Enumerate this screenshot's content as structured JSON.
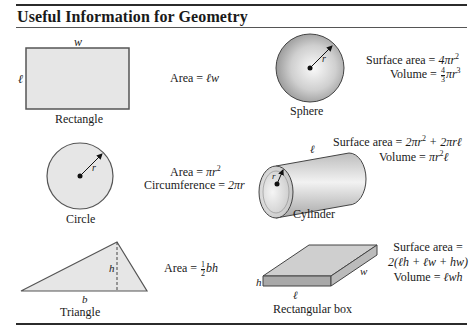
{
  "header": {
    "title": "Useful Information for Geometry"
  },
  "shapes": [
    {
      "name": "Rectangle",
      "dimension_labels": {
        "top": "w",
        "side": "ℓ"
      },
      "formulas": [
        "Area = ℓw"
      ]
    },
    {
      "name": "Sphere",
      "dimension_labels": {
        "radius": "r"
      },
      "formulas": [
        "Surface area = 4πr²",
        "Volume = 4/3 πr³"
      ]
    },
    {
      "name": "Circle",
      "dimension_labels": {
        "radius": "r"
      },
      "formulas": [
        "Area = πr²",
        "Circumference = 2πr"
      ]
    },
    {
      "name": "Cylinder",
      "dimension_labels": {
        "length": "ℓ",
        "radius": "r"
      },
      "formulas": [
        "Surface area = 2πr² + 2πrℓ",
        "Volume = πr²ℓ"
      ]
    },
    {
      "name": "Triangle",
      "dimension_labels": {
        "base": "b",
        "height": "h"
      },
      "formulas": [
        "Area = 1/2 bh"
      ]
    },
    {
      "name": "Rectangular box",
      "dimension_labels": {
        "height": "h",
        "length": "ℓ",
        "width": "w"
      },
      "formulas": [
        "Surface area =",
        "2(ℓh + ℓw + hw)",
        "Volume = ℓwh"
      ]
    }
  ],
  "text": {
    "area_prefix": "Area = ",
    "surface_area_prefix": "Surface area = ",
    "volume_prefix": "Volume = ",
    "circumference_prefix": "Circumference = ",
    "rect_area_expr": "ℓw",
    "sphere_sa_expr": "4πr",
    "sphere_vol_num": "4",
    "sphere_vol_den": "3",
    "sphere_vol_expr": "πr",
    "circle_area_expr": "πr",
    "circle_circ_expr": "2πr",
    "cyl_sa_expr_1": "2πr",
    "cyl_sa_expr_2": " + 2πrℓ",
    "cyl_vol_expr_1": "πr",
    "cyl_vol_expr_2": "ℓ",
    "tri_frac_num": "1",
    "tri_frac_den": "2",
    "tri_area_expr": "bh",
    "box_sa_label": "Surface area =",
    "box_sa_expr": "2(ℓh + ℓw + hw)",
    "box_vol_expr": "ℓwh",
    "exp2": "2",
    "exp3": "3"
  },
  "colors": {
    "fill_gray": "#e6e6e6",
    "stroke": "#444444",
    "rule": "#2b2b2b"
  }
}
